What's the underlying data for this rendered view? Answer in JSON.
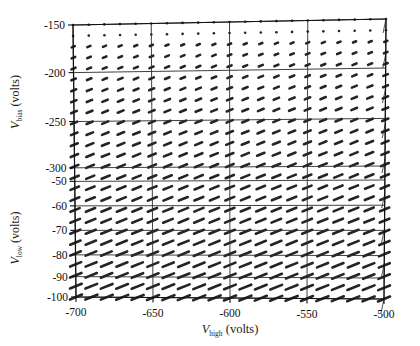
{
  "figure": {
    "type": "3d-mesh-plot",
    "background_color": "#ffffff",
    "ink_color": "#1f1f1f"
  },
  "axes": {
    "x": {
      "name": "V",
      "subscript": "high",
      "unit": "(volts)",
      "label": "V_high (volts)",
      "ticks": [
        "-700",
        "-650",
        "-600",
        "-550",
        "-500"
      ],
      "values": [
        -700,
        -650,
        -600,
        -550,
        -500
      ],
      "min": -710,
      "max": -495
    },
    "y_upper": {
      "name": "V",
      "subscript": "bias",
      "unit": "(volts)",
      "label": "V_bias (volts)",
      "ticks": [
        "-150",
        "-200",
        "-250",
        "-300"
      ],
      "values": [
        -150,
        -200,
        -250,
        -300
      ],
      "min": -310,
      "max": -148
    },
    "y_lower": {
      "name": "V",
      "subscript": "low",
      "unit": "(volts)",
      "label": "V_low (volts)",
      "ticks": [
        "-50",
        "-60",
        "-70",
        "-80",
        "-90",
        "-100"
      ],
      "values": [
        -50,
        -60,
        -70,
        -80,
        -90,
        -100
      ],
      "min": -100,
      "max": -48
    }
  },
  "chart_data": {
    "type": "scatter",
    "title": "",
    "xlabel": "V_high (volts)",
    "ylabel": "V_bias (volts) / V_low (volts)",
    "grid": true,
    "legend": "none",
    "projection": "parallel-oblique-3d",
    "x": [
      -700,
      -690,
      -680,
      -670,
      -660,
      -650,
      -640,
      -630,
      -620,
      -610,
      -600,
      -590,
      -580,
      -570,
      -560,
      -550,
      -540,
      -530,
      -520,
      -510,
      -500
    ],
    "xlim": [
      -710,
      -495
    ],
    "ylim_upper": [
      -310,
      -148
    ],
    "ylim_lower": [
      -100,
      -48
    ],
    "grid_columns": 21,
    "grid_rows": 26,
    "glyph": {
      "shape": "tilted-dash",
      "tilt_degrees": -22,
      "min_length_px": 2,
      "max_length_px": 13,
      "thickness_px": 2.6
    },
    "gridlines_horizontal_at_y": [
      -150,
      -200,
      -250,
      -300,
      -50,
      -60,
      -70,
      -80,
      -90,
      -100
    ],
    "gridlines_vertical_at_x": [
      -700,
      -650,
      -600,
      -550,
      -500
    ]
  }
}
